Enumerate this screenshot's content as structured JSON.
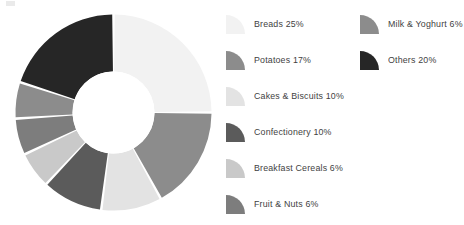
{
  "chart_data": {
    "type": "pie",
    "variant": "donut",
    "title": "",
    "subtitle": "",
    "xlabel": "",
    "ylabel": "",
    "legend_position": "right",
    "grid": false,
    "units": "%",
    "total": 100,
    "start_angle_deg": 0,
    "direction": "clockwise",
    "categories": [
      "Breads",
      "Potatoes",
      "Cakes & Biscuits",
      "Confectionery",
      "Breakfast Cereals",
      "Fruit & Nuts",
      "Milk & Yoghurt",
      "Others"
    ],
    "values": [
      25,
      17,
      10,
      10,
      6,
      6,
      6,
      20
    ],
    "colors": [
      "#f2f2f2",
      "#8c8c8c",
      "#e3e3e3",
      "#5b5b5b",
      "#c9c9c9",
      "#7d7d7d",
      "#8c8c8c",
      "#262626"
    ],
    "slices": [
      {
        "label": "Breads",
        "value": 25,
        "display": "Breads 25%",
        "color": "#f2f2f2"
      },
      {
        "label": "Potatoes",
        "value": 17,
        "display": "Potatoes 17%",
        "color": "#8c8c8c"
      },
      {
        "label": "Cakes & Biscuits",
        "value": 10,
        "display": "Cakes & Biscuits 10%",
        "color": "#e3e3e3"
      },
      {
        "label": "Confectionery",
        "value": 10,
        "display": "Confectionery 10%",
        "color": "#5b5b5b"
      },
      {
        "label": "Breakfast Cereals",
        "value": 6,
        "display": "Breakfast Cereals 6%",
        "color": "#c9c9c9"
      },
      {
        "label": "Fruit & Nuts",
        "value": 6,
        "display": "Fruit & Nuts 6%",
        "color": "#7d7d7d"
      },
      {
        "label": "Milk & Yoghurt",
        "value": 6,
        "display": "Milk & Yoghurt 6%",
        "color": "#8c8c8c"
      },
      {
        "label": "Others",
        "value": 20,
        "display": "Others 20%",
        "color": "#262626"
      }
    ]
  },
  "legend": {
    "left_column": [
      {
        "text": "Breads 25%",
        "color": "#f2f2f2",
        "icon": "pie-wedge-swatch-icon"
      },
      {
        "text": "Potatoes 17%",
        "color": "#8c8c8c",
        "icon": "pie-wedge-swatch-icon"
      },
      {
        "text": "Cakes & Biscuits 10%",
        "color": "#e3e3e3",
        "icon": "pie-wedge-swatch-icon"
      },
      {
        "text": "Confectionery 10%",
        "color": "#5b5b5b",
        "icon": "pie-wedge-swatch-icon"
      },
      {
        "text": "Breakfast Cereals 6%",
        "color": "#c9c9c9",
        "icon": "pie-wedge-swatch-icon"
      },
      {
        "text": "Fruit & Nuts 6%",
        "color": "#7d7d7d",
        "icon": "pie-wedge-swatch-icon"
      }
    ],
    "right_column": [
      {
        "text": "Milk & Yoghurt 6%",
        "color": "#8c8c8c",
        "icon": "pie-wedge-swatch-icon"
      },
      {
        "text": "Others 20%",
        "color": "#262626",
        "icon": "pie-wedge-swatch-icon"
      }
    ]
  },
  "style": {
    "background": "#ffffff",
    "text_color": "#3f3f3f",
    "separator_color": "#ffffff",
    "hole_color": "#ffffff"
  }
}
